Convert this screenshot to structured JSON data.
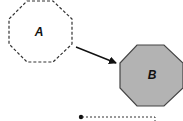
{
  "diagram": {
    "nodes": [
      {
        "id": "A",
        "label": "A",
        "shape": "octagon",
        "border": "dashed",
        "fill": "#ffffff",
        "stroke": "#333333"
      },
      {
        "id": "B",
        "label": "B",
        "shape": "octagon",
        "border": "solid",
        "fill": "#b3b3b3",
        "stroke": "#444444"
      }
    ],
    "edges": [
      {
        "from": "A",
        "to": "B",
        "style": "solid",
        "arrowhead": "filled-triangle"
      }
    ],
    "connector": {
      "style": "dashed",
      "start": "filled-dot"
    }
  }
}
